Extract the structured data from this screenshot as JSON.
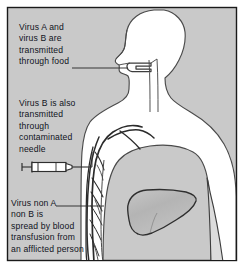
{
  "figure": {
    "background_color": "#c9c9c9",
    "border_color": "#1a1a1a",
    "page_color": "#ffffff",
    "body_fill": "#ffffff",
    "outline_color": "#3a3a3a",
    "text_color": "#10131c",
    "liver_fill": "#b9b9b9",
    "vessel_color": "#2b2b2b",
    "syringe_fill": "#ffffff"
  },
  "annotations": [
    {
      "id": "food",
      "name": "annotation-food",
      "lines": [
        "Virus A and",
        "virus B are",
        "transmitted",
        "through food"
      ],
      "target": "mouth",
      "leader": true
    },
    {
      "id": "needle",
      "name": "annotation-needle",
      "lines": [
        "Virus B is also",
        "transmitted",
        "through",
        "contaminated",
        "needle"
      ],
      "target": "arm-vein",
      "leader": true
    },
    {
      "id": "blood",
      "name": "annotation-blood",
      "lines": [
        "Virus non A",
        "non B is",
        "spread by blood",
        "transfusion from",
        "an afflicted person"
      ],
      "target": "arm-vessels",
      "leader": true
    }
  ],
  "anatomy": {
    "body": "human upper torso and head in profile",
    "organs": [
      "liver",
      "esophagus",
      "mouth",
      "throat"
    ],
    "vessels": "blood vessel network in arm and shoulder",
    "instrument": "syringe"
  }
}
